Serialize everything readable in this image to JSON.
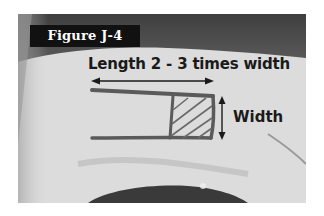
{
  "figure": {
    "label": "Figure J-4",
    "annotations": {
      "length": "Length 2 - 3 times width",
      "width": "Width"
    },
    "drawing": {
      "shape": "rectangle with hatched square at end",
      "length_arrow": "double-headed horizontal",
      "width_arrow": "double-headed vertical"
    },
    "colors": {
      "label_background": "#111111",
      "label_text": "#ffffff",
      "annotation_text": "#1a1a1a",
      "skin": "#dedede",
      "background_dark": "#4a4a4a",
      "marker": "#555555"
    }
  }
}
